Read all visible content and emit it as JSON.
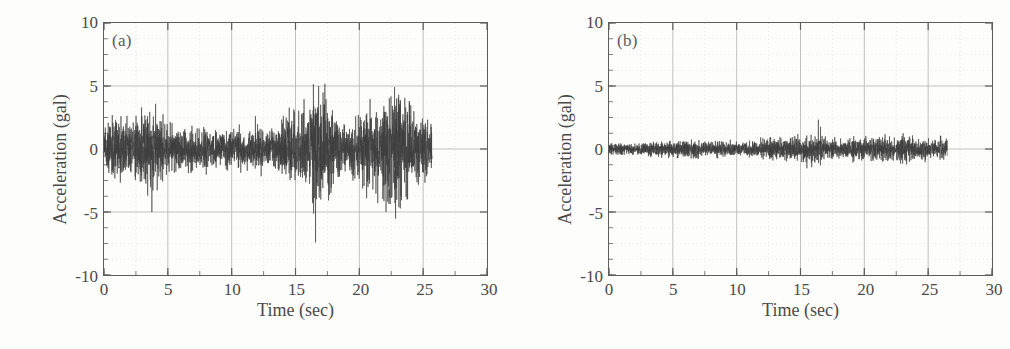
{
  "figure": {
    "width": 1010,
    "height": 349,
    "background": "#fdfdfc",
    "trace_color": "#3c3c3c",
    "axis_color": "#5d5d5d",
    "grid_color": "#b9b9b9",
    "minor_grid_color": "#d8d8d8",
    "text_color": "#4a4a4a"
  },
  "chart_data": [
    {
      "type": "line",
      "panel": "(a)",
      "title": "",
      "xlabel": "Time (sec)",
      "ylabel": "Acceleration (gal)",
      "xlim": [
        0,
        30
      ],
      "ylim": [
        -10,
        10
      ],
      "xticks": [
        0,
        5,
        10,
        15,
        20,
        25,
        30
      ],
      "yticks": [
        10,
        5,
        0,
        -5,
        -10
      ],
      "xtick_labels": [
        "0",
        "5",
        "10",
        "15",
        "20",
        "25",
        "30"
      ],
      "ytick_labels": [
        "10",
        "5",
        "0",
        "-5",
        "-10"
      ],
      "minor_tick_step_x": 2.5,
      "minor_tick_step_y": 1.25,
      "grid": true,
      "legend": "none",
      "signal_start": 0.0,
      "signal_end": 25.7,
      "sample_step_sec": 0.01,
      "description": "Dense random acceleration time history, amplitude grows after 13 sec",
      "envelope_time": [
        0,
        1,
        2,
        3,
        3.6,
        5,
        7,
        9,
        11,
        13,
        14,
        15,
        16,
        16.5,
        17.5,
        19,
        20,
        21,
        22,
        23,
        24,
        25,
        25.7
      ],
      "envelope_amplitude": [
        2.4,
        3.3,
        3.0,
        3.9,
        4.8,
        2.6,
        2.3,
        2.2,
        2.2,
        2.4,
        3.3,
        3.6,
        4.6,
        8.0,
        4.4,
        3.0,
        3.6,
        5.0,
        5.4,
        7.8,
        4.6,
        3.4,
        2.8
      ],
      "peak_max": 8.0,
      "peak_min": -7.5
    },
    {
      "type": "line",
      "panel": "(b)",
      "title": "",
      "xlabel": "Time (sec)",
      "ylabel": "Acceleration (gal)",
      "xlim": [
        0,
        30
      ],
      "ylim": [
        -10,
        10
      ],
      "xticks": [
        0,
        5,
        10,
        15,
        20,
        25,
        30
      ],
      "yticks": [
        10,
        5,
        0,
        -5,
        -10
      ],
      "xtick_labels": [
        "0",
        "5",
        "10",
        "15",
        "20",
        "25",
        "30"
      ],
      "ytick_labels": [
        "10",
        "5",
        "0",
        "-5",
        "-10"
      ],
      "minor_tick_step_x": 2.5,
      "minor_tick_step_y": 1.25,
      "grid": true,
      "legend": "none",
      "signal_start": 0.0,
      "signal_end": 26.5,
      "sample_step_sec": 0.01,
      "description": "Low amplitude random acceleration time history, band near zero",
      "envelope_time": [
        0,
        2,
        4,
        6,
        8,
        10,
        12,
        13,
        14,
        15,
        16,
        17,
        18,
        20,
        21,
        22,
        23,
        24,
        25,
        26.5
      ],
      "envelope_amplitude": [
        0.55,
        0.7,
        0.8,
        0.95,
        0.9,
        0.85,
        1.0,
        1.3,
        1.2,
        1.35,
        1.9,
        1.2,
        1.0,
        1.25,
        1.35,
        1.2,
        1.5,
        1.3,
        1.15,
        1.5
      ],
      "peak_max": 1.9,
      "peak_min": -1.9
    }
  ]
}
